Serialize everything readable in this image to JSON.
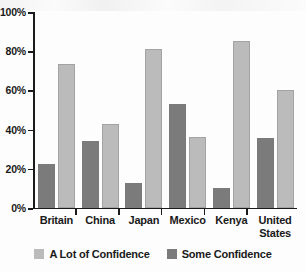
{
  "chart_data": {
    "type": "bar",
    "title": "",
    "xlabel": "",
    "ylabel": "",
    "ylim": [
      0,
      100
    ],
    "grid": false,
    "legend_position": "bottom",
    "categories": [
      "Britain",
      "China",
      "Japan",
      "Mexico",
      "Kenya",
      "United States"
    ],
    "ytick_labels": [
      "0%",
      "20%",
      "40%",
      "60%",
      "80%",
      "100%"
    ],
    "ytick_values": [
      0,
      20,
      40,
      60,
      80,
      100
    ],
    "series": [
      {
        "name": "A Lot of Confidence",
        "color": "#bbbbbb",
        "values": [
          73.5,
          43,
          81,
          36,
          85,
          60
        ]
      },
      {
        "name": "Some Confidence",
        "color": "#7b7b7b",
        "values": [
          22.5,
          34,
          13,
          53,
          10,
          35.5
        ]
      }
    ]
  },
  "axis": {
    "ticks": [
      {
        "label": "100%",
        "value": 100
      },
      {
        "label": "80%",
        "value": 80
      },
      {
        "label": "60%",
        "value": 60
      },
      {
        "label": "40%",
        "value": 40
      },
      {
        "label": "20%",
        "value": 20
      },
      {
        "label": "0%",
        "value": 0
      }
    ]
  },
  "categories": [
    {
      "label": "Britain"
    },
    {
      "label": "China"
    },
    {
      "label": "Japan"
    },
    {
      "label": "Mexico"
    },
    {
      "label": "Kenya"
    },
    {
      "label": "United\nStates"
    }
  ],
  "legend": {
    "items": [
      {
        "label": "A Lot of Confidence",
        "swatch": "legend-swatch-a-lot-of-confidence",
        "color": "#bbbbbb"
      },
      {
        "label": "Some Confidence",
        "swatch": "legend-swatch-some-confidence",
        "color": "#7b7b7b"
      }
    ]
  }
}
